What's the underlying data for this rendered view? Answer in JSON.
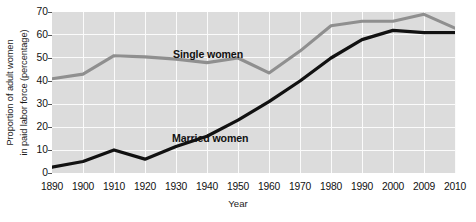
{
  "chart_data": {
    "type": "line",
    "title": "",
    "xlabel": "Year",
    "ylabel_line1": "Proportion of adult women",
    "ylabel_line2": "in paid labor force (percentage)",
    "categories": [
      "1890",
      "1900",
      "1910",
      "1920",
      "1930",
      "1940",
      "1950",
      "1960",
      "1970",
      "1980",
      "1990",
      "2000",
      "2009",
      "2010"
    ],
    "x_values": [
      1890,
      1900,
      1910,
      1920,
      1930,
      1940,
      1950,
      1960,
      1970,
      1980,
      1990,
      2000,
      2009,
      2010
    ],
    "ylim": [
      0,
      70
    ],
    "y_ticks": [
      0,
      10,
      20,
      30,
      40,
      50,
      60,
      70
    ],
    "grid": true,
    "legend_position": "inline-annotation",
    "series": [
      {
        "name": "Single women",
        "color": "#8f8f8f",
        "values": [
          41,
          43,
          51,
          50.5,
          49.5,
          48,
          50,
          43.5,
          53,
          64,
          66,
          66,
          69,
          63
        ]
      },
      {
        "name": "Married women",
        "color": "#111111",
        "values": [
          2.5,
          5,
          10,
          6,
          11.5,
          16,
          23,
          31,
          40,
          50,
          58,
          62,
          61,
          61
        ]
      }
    ],
    "annotations": [
      {
        "text": "Single women",
        "series": "Single women"
      },
      {
        "text": "Married women",
        "series": "Married women"
      }
    ]
  },
  "axes": {
    "y_ticks": [
      "70",
      "60",
      "50",
      "40",
      "30",
      "20",
      "10",
      "0"
    ],
    "x_ticks": [
      "1890",
      "1900",
      "1910",
      "1920",
      "1930",
      "1940",
      "1950",
      "1960",
      "1970",
      "1980",
      "1990",
      "2000",
      "2009",
      "2010"
    ],
    "x_title": "Year",
    "y_title_line1": "Proportion of adult women",
    "y_title_line2": "in paid labor force (percentage)"
  },
  "labels": {
    "single_women": "Single women",
    "married_women": "Married women"
  },
  "colors": {
    "plot_background": "#dcdcdc",
    "gridline": "#fbfbfb",
    "single_women_line": "#8f8f8f",
    "married_women_line": "#111111",
    "text": "#111111"
  }
}
